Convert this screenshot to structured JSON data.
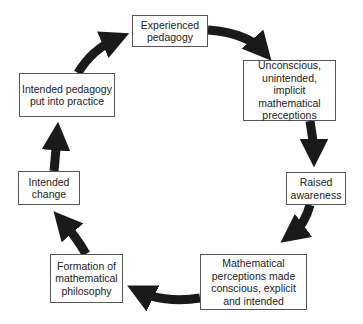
{
  "diagram": {
    "type": "cycle",
    "colors": {
      "arrow": "#1a1a1a",
      "box_border": "#555555",
      "text": "#222222",
      "background": "#ffffff"
    },
    "nodes": [
      {
        "id": "experienced-pedagogy",
        "label": "Experienced\npedagogy"
      },
      {
        "id": "unconscious-perceptions",
        "label": "Unconscious,\nunintended, implicit\nmathematical\npreceptions"
      },
      {
        "id": "raised-awareness",
        "label": "Raised\nawareness"
      },
      {
        "id": "perceptions-made-conscious",
        "label": "Mathematical\nperceptions made\nconscious, explicit\nand intended"
      },
      {
        "id": "formation-of-philosophy",
        "label": "Formation of\nmathematical\nphilosophy"
      },
      {
        "id": "intended-change",
        "label": "Intended\nchange"
      },
      {
        "id": "intended-pedagogy-practice",
        "label": "Intended pedagogy\nput into practice"
      }
    ],
    "edges": [
      {
        "from": "experienced-pedagogy",
        "to": "unconscious-perceptions"
      },
      {
        "from": "unconscious-perceptions",
        "to": "raised-awareness"
      },
      {
        "from": "raised-awareness",
        "to": "perceptions-made-conscious"
      },
      {
        "from": "perceptions-made-conscious",
        "to": "formation-of-philosophy"
      },
      {
        "from": "formation-of-philosophy",
        "to": "intended-change"
      },
      {
        "from": "intended-change",
        "to": "intended-pedagogy-practice"
      },
      {
        "from": "intended-pedagogy-practice",
        "to": "experienced-pedagogy"
      }
    ]
  }
}
